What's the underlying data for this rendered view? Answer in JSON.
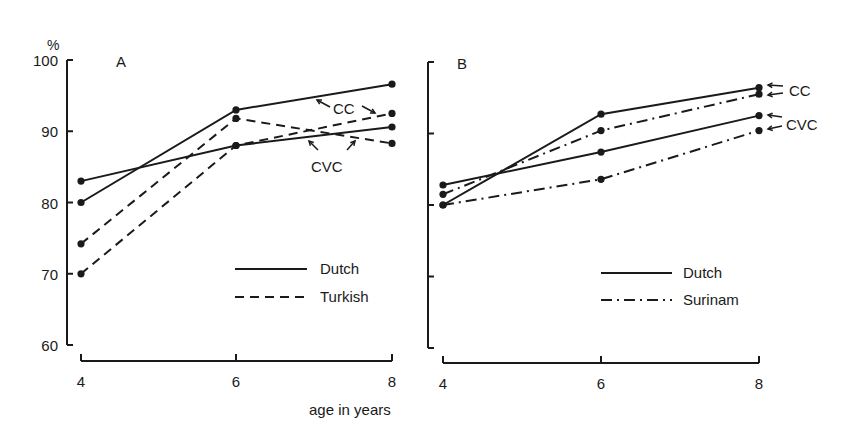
{
  "figure": {
    "xlabel": "age in years",
    "ylabel_unit": "%"
  },
  "chart_data": [
    {
      "type": "line",
      "panel": "A",
      "title": "A",
      "xlabel": "age in years",
      "ylabel": "%",
      "x": [
        4,
        6,
        8
      ],
      "x_ticks": [
        "4",
        "6",
        "8"
      ],
      "y_ticks": [
        "100",
        "90",
        "80",
        "70",
        "60"
      ],
      "ylim": [
        60,
        100
      ],
      "grid": false,
      "legend": [
        {
          "label": "Dutch",
          "style": "solid"
        },
        {
          "label": "Turkish",
          "style": "dashed"
        }
      ],
      "legend_position": "lower right",
      "series": [
        {
          "name": "Dutch CC",
          "group": "Dutch",
          "syllable": "CC",
          "style": "solid",
          "values": [
            80.0,
            93.0,
            96.6
          ]
        },
        {
          "name": "Dutch CVC",
          "group": "Dutch",
          "syllable": "CVC",
          "style": "solid",
          "values": [
            83.0,
            88.0,
            90.6
          ]
        },
        {
          "name": "Turkish CC",
          "group": "Turkish",
          "syllable": "CC",
          "style": "dashed",
          "values": [
            74.2,
            91.8,
            88.3
          ]
        },
        {
          "name": "Turkish CVC",
          "group": "Turkish",
          "syllable": "CVC",
          "style": "dashed",
          "values": [
            70.0,
            88.0,
            92.5
          ]
        }
      ],
      "annotations": [
        "CC",
        "CVC"
      ]
    },
    {
      "type": "line",
      "panel": "B",
      "title": "B",
      "xlabel": "age in years",
      "ylabel": "%",
      "x": [
        4,
        6,
        8
      ],
      "x_ticks": [
        "4",
        "6",
        "8"
      ],
      "y_ticks": [],
      "ylim": [
        60,
        100
      ],
      "grid": false,
      "legend": [
        {
          "label": "Dutch",
          "style": "solid"
        },
        {
          "label": "Surinam",
          "style": "dashdot"
        }
      ],
      "legend_position": "lower right",
      "series": [
        {
          "name": "Dutch CC",
          "group": "Dutch",
          "syllable": "CC",
          "style": "solid",
          "values": [
            80.0,
            92.7,
            96.4
          ]
        },
        {
          "name": "Dutch CVC",
          "group": "Dutch",
          "syllable": "CVC",
          "style": "solid",
          "values": [
            82.8,
            87.4,
            92.5
          ]
        },
        {
          "name": "Surinam CC",
          "group": "Surinam",
          "syllable": "CC",
          "style": "dashdot",
          "values": [
            81.5,
            90.4,
            95.5
          ]
        },
        {
          "name": "Surinam CVC",
          "group": "Surinam",
          "syllable": "CVC",
          "style": "dashdot",
          "values": [
            80.0,
            83.6,
            90.4
          ]
        }
      ],
      "annotations": [
        "CC",
        "CVC"
      ]
    }
  ],
  "layout": {
    "panels": [
      {
        "yaxis_x": 67,
        "y_top": 60,
        "y_bottom": 345,
        "x_px": [
          81,
          236,
          392
        ],
        "xaxis_y": 361,
        "tick_label_x": 58,
        "title_pos": [
          116,
          67
        ],
        "legend_x": [
          235,
          307
        ],
        "legend_y": [
          269,
          297
        ],
        "legend_text_x": 320,
        "labels": [
          {
            "text_key": 0,
            "x": 333,
            "y": 114,
            "arrows": [
              [
                330,
                107,
                317,
                100
              ],
              [
                362,
                106,
                375,
                113
              ]
            ]
          },
          {
            "text_key": 1,
            "x": 311,
            "y": 172,
            "arrows": [
              [
                318,
                150,
                309,
                141
              ],
              [
                347,
                150,
                355,
                141
              ]
            ]
          }
        ]
      },
      {
        "yaxis_x": 428,
        "y_top": 62,
        "y_bottom": 348,
        "x_px": [
          443,
          601,
          759
        ],
        "xaxis_y": 363,
        "tick_label_x": null,
        "title_pos": [
          457,
          69
        ],
        "legend_x": [
          601,
          672
        ],
        "legend_y": [
          273,
          300
        ],
        "legend_text_x": 683,
        "labels": [
          {
            "text_key": 0,
            "x": 789,
            "y": 96,
            "arrows": [
              [
                783,
                86,
                768,
                85
              ],
              [
                783,
                93,
                768,
                95
              ]
            ]
          },
          {
            "text_key": 1,
            "x": 786,
            "y": 130,
            "arrows": [
              [
                782,
                117,
                768,
                115
              ],
              [
                782,
                126,
                768,
                129
              ]
            ]
          }
        ]
      }
    ],
    "xlabel_pos": [
      309,
      415
    ],
    "unit_pos": [
      47,
      50
    ]
  }
}
